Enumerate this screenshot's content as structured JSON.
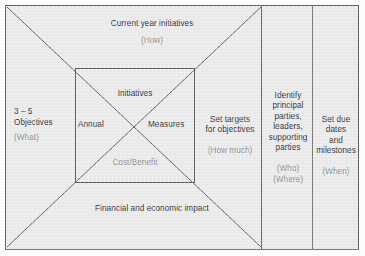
{
  "diagram": {
    "background_color": "#ececec",
    "border_color": "#5a5a5a",
    "line_color": "#4a4a4a",
    "text_color": "#2b2b2b",
    "muted_text_color": "#8d8d8d",
    "bands": {
      "top": {
        "label": "Current year initiatives",
        "question": "(How)"
      },
      "left": {
        "label": "3 – 5\nObjectives",
        "question": "(What)"
      },
      "bottom": {
        "label": "Financial and economic impact",
        "question": ""
      }
    },
    "inner_box": {
      "top": "Initiatives",
      "left": "Annual",
      "right": "Measures",
      "bottom": "Cost/Benefit"
    },
    "columns": [
      {
        "label": "Set targets\nfor objectives",
        "question": "(How much)"
      },
      {
        "label": "Identify\nprincipal\nparties,\nleaders,\nsupporting\nparties",
        "question": "(Who)\n(Where)"
      },
      {
        "label": "Set due\ndates\nand\nmilestones",
        "question": "(When)"
      }
    ]
  }
}
